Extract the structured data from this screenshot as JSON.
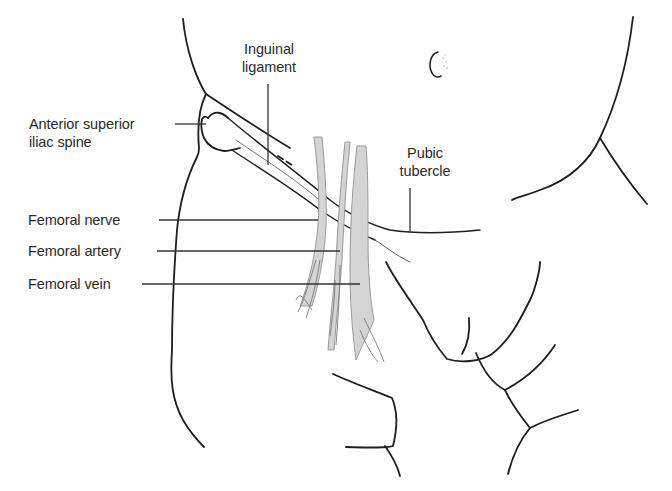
{
  "figure": {
    "type": "anatomical line illustration",
    "colors": {
      "outline": "#1e1e1e",
      "leader_line": "#333333",
      "vessel_fill": "#d4d4d4",
      "vessel_stroke": "#9a9a9a",
      "background": "#ffffff"
    }
  },
  "labels": {
    "inguinal_ligament": {
      "line1": "Inguinal",
      "line2": "ligament"
    },
    "asis": {
      "line1": "Anterior superior",
      "line2": "iliac spine"
    },
    "pubic_tubercle": {
      "line1": "Pubic",
      "line2": "tubercle"
    },
    "femoral_nerve": "Femoral nerve",
    "femoral_artery": "Femoral artery",
    "femoral_vein": "Femoral vein"
  }
}
